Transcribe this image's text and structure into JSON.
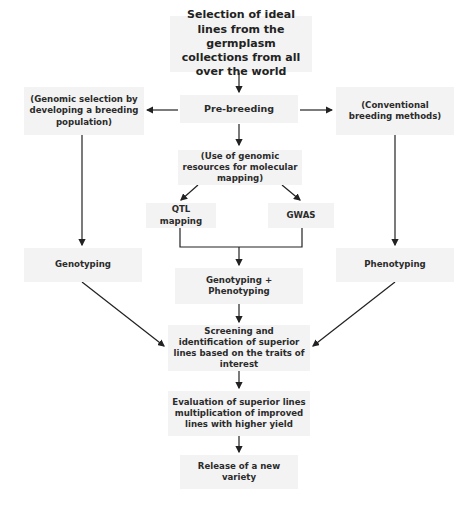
{
  "diagram": {
    "type": "flowchart",
    "nodes": {
      "selection": "Selection of ideal lines from the germplasm collections from all over the world",
      "prebreeding": "Pre-breeding",
      "genomic_selection": "(Genomic selection by developing a breeding population)",
      "conventional": "(Conventional breeding methods)",
      "genomic_resources": "(Use of genomic resources for molecular mapping)",
      "qtl": "QTL mapping",
      "gwas": "GWAS",
      "genotyping": "Genotyping",
      "geno_pheno": "Genotyping + Phenotyping",
      "phenotyping": "Phenotyping",
      "screening": "Screening and identification of superior lines based on the traits of interest",
      "evaluation": "Evaluation of superior lines multiplication of improved lines with higher yield",
      "release": "Release of a new variety"
    },
    "edges": [
      [
        "selection",
        "prebreeding"
      ],
      [
        "prebreeding",
        "genomic_selection"
      ],
      [
        "prebreeding",
        "conventional"
      ],
      [
        "prebreeding",
        "genomic_resources"
      ],
      [
        "genomic_resources",
        "qtl"
      ],
      [
        "genomic_resources",
        "gwas"
      ],
      [
        "qtl",
        "geno_pheno"
      ],
      [
        "gwas",
        "geno_pheno"
      ],
      [
        "genomic_selection",
        "genotyping"
      ],
      [
        "conventional",
        "phenotyping"
      ],
      [
        "genotyping",
        "screening"
      ],
      [
        "geno_pheno",
        "screening"
      ],
      [
        "phenotyping",
        "screening"
      ],
      [
        "screening",
        "evaluation"
      ],
      [
        "evaluation",
        "release"
      ]
    ],
    "colors": {
      "box": "#f3f3f3",
      "line": "#222222",
      "text": "#2b2b2b"
    }
  }
}
